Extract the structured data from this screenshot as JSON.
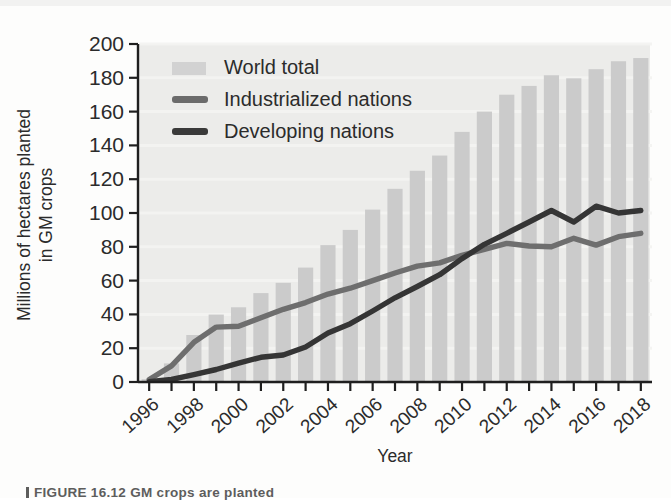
{
  "figure": {
    "caption_partial": "FIGURE 16.12  GM crops are planted"
  },
  "axes": {
    "y_title_line1": "Millions of hectares planted",
    "y_title_line2": "in GM crops",
    "x_title": "Year",
    "y_ticks": [
      "0",
      "20",
      "40",
      "60",
      "80",
      "100",
      "120",
      "140",
      "160",
      "180",
      "200"
    ],
    "x_ticks": [
      "1996",
      "1998",
      "2000",
      "2002",
      "2004",
      "2006",
      "2008",
      "2010",
      "2012",
      "2014",
      "2016",
      "2018"
    ]
  },
  "legend": {
    "position": "top-left",
    "items": [
      {
        "label": "World total",
        "marker": "bar-swatch",
        "color": "#d2d2d2"
      },
      {
        "label": "Industrialized nations",
        "marker": "line-swatch",
        "color": "#6b6b6b"
      },
      {
        "label": "Developing nations",
        "marker": "line-swatch",
        "color": "#3a3a3a"
      }
    ]
  },
  "colors": {
    "bar": "#cbcbcb",
    "plot_background": "#ececea",
    "industrialized": "#6e6e6e",
    "developing": "#353535",
    "axis": "#1f1f1f",
    "gridline": "#f4f4f2"
  },
  "chart_data": {
    "type": "bar",
    "title": "",
    "subtitle": "",
    "xlabel": "Year",
    "ylabel": "Millions of hectares planted in GM crops",
    "xlim": [
      1996,
      2018
    ],
    "ylim": [
      0,
      200
    ],
    "ytick_step": 20,
    "grid": false,
    "legend_position": "top-left",
    "x": [
      1996,
      1997,
      1998,
      1999,
      2000,
      2001,
      2002,
      2003,
      2004,
      2005,
      2006,
      2007,
      2008,
      2009,
      2010,
      2011,
      2012,
      2013,
      2014,
      2015,
      2016,
      2017,
      2018
    ],
    "categories": [
      "1996",
      "1997",
      "1998",
      "1999",
      "2000",
      "2001",
      "2002",
      "2003",
      "2004",
      "2005",
      "2006",
      "2007",
      "2008",
      "2009",
      "2010",
      "2011",
      "2012",
      "2013",
      "2014",
      "2015",
      "2016",
      "2017",
      "2018"
    ],
    "series": [
      {
        "name": "World total",
        "type": "bar",
        "color": "#cbcbcb",
        "values": [
          1.7,
          11,
          27.8,
          39.9,
          44.2,
          52.6,
          58.7,
          67.7,
          81,
          90,
          102,
          114.3,
          125,
          134,
          148,
          160,
          170,
          175.2,
          181.5,
          179.7,
          185.1,
          189.8,
          191.7
        ]
      },
      {
        "name": "Industrialized nations",
        "type": "line",
        "color": "#6e6e6e",
        "values": [
          1.5,
          9.5,
          23.5,
          32.5,
          33,
          38,
          43,
          47,
          52,
          55.5,
          60,
          64.5,
          68.5,
          70.5,
          75,
          78.5,
          82,
          80.5,
          80,
          85,
          81,
          86,
          88
        ]
      },
      {
        "name": "Developing nations",
        "type": "line",
        "color": "#353535",
        "values": [
          0.2,
          1.5,
          4.3,
          7.4,
          11.2,
          14.6,
          16,
          20.7,
          29,
          34.5,
          42,
          49.8,
          56.5,
          63.5,
          73,
          81.5,
          88,
          94.7,
          101.5,
          94.7,
          104,
          100,
          101.5
        ]
      }
    ]
  }
}
